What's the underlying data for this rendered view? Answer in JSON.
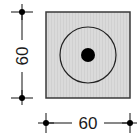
{
  "diagram": {
    "type": "dimension-drawing",
    "plate": {
      "shape": "square",
      "fill": "#d9d9d9",
      "stroke": "#333333"
    },
    "outer_circle": {
      "stroke": "#222222"
    },
    "center_dot": {
      "fill": "#000000"
    },
    "dimensions": {
      "height": {
        "value": "60",
        "orientation": "vertical"
      },
      "width": {
        "value": "60",
        "orientation": "horizontal"
      }
    }
  }
}
